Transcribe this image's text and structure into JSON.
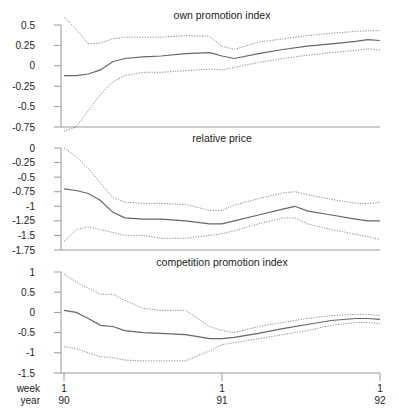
{
  "chart_data": [
    {
      "type": "line",
      "title": "own promotion index",
      "xlabel": "",
      "ylabel": "",
      "yticks": [
        "0.5",
        "0.25",
        "0",
        "-0.25",
        "-0.5",
        "-0.75"
      ],
      "ytick_values": [
        0.5,
        0.25,
        0,
        -0.25,
        -0.5,
        -0.75
      ],
      "ylim": [
        -0.75,
        0.5
      ],
      "x_weeks": [
        0,
        4,
        8,
        12,
        16,
        20,
        26,
        32,
        40,
        48,
        52,
        56,
        64,
        72,
        80,
        88,
        96,
        100,
        104
      ],
      "series": [
        {
          "name": "estimate",
          "style": "solid",
          "values": [
            -0.12,
            -0.12,
            -0.1,
            -0.05,
            0.05,
            0.09,
            0.11,
            0.12,
            0.15,
            0.16,
            0.12,
            0.09,
            0.15,
            0.2,
            0.24,
            0.27,
            0.3,
            0.32,
            0.31
          ]
        },
        {
          "name": "upper bound",
          "style": "dotted",
          "values": [
            0.6,
            0.45,
            0.27,
            0.28,
            0.33,
            0.35,
            0.35,
            0.35,
            0.37,
            0.36,
            0.24,
            0.2,
            0.29,
            0.33,
            0.37,
            0.4,
            0.42,
            0.43,
            0.43
          ]
        },
        {
          "name": "lower bound",
          "style": "dotted",
          "values": [
            -0.85,
            -0.75,
            -0.55,
            -0.35,
            -0.2,
            -0.12,
            -0.08,
            -0.08,
            -0.06,
            -0.04,
            -0.05,
            -0.02,
            0.04,
            0.09,
            0.13,
            0.16,
            0.19,
            0.21,
            0.19
          ]
        }
      ]
    },
    {
      "type": "line",
      "title": "relative price",
      "xlabel": "",
      "ylabel": "",
      "yticks": [
        "0",
        "-0.25",
        "-0.5",
        "-0.75",
        "-1",
        "-1.25",
        "-1.5",
        "-1.75"
      ],
      "ytick_values": [
        0,
        -0.25,
        -0.5,
        -0.75,
        -1,
        -1.25,
        -1.5,
        -1.75
      ],
      "ylim": [
        -1.75,
        0
      ],
      "x_weeks": [
        0,
        4,
        8,
        12,
        16,
        20,
        26,
        32,
        40,
        48,
        52,
        56,
        64,
        72,
        76,
        80,
        88,
        96,
        100,
        104
      ],
      "series": [
        {
          "name": "estimate",
          "style": "solid",
          "values": [
            -0.7,
            -0.73,
            -0.78,
            -0.9,
            -1.1,
            -1.2,
            -1.22,
            -1.22,
            -1.25,
            -1.3,
            -1.3,
            -1.25,
            -1.15,
            -1.05,
            -1.0,
            -1.08,
            -1.15,
            -1.22,
            -1.25,
            -1.25
          ]
        },
        {
          "name": "upper bound",
          "style": "dotted",
          "values": [
            0.0,
            -0.15,
            -0.35,
            -0.6,
            -0.85,
            -0.93,
            -0.95,
            -0.95,
            -0.97,
            -1.07,
            -1.07,
            -0.98,
            -0.87,
            -0.77,
            -0.75,
            -0.8,
            -0.88,
            -0.95,
            -0.95,
            -0.93
          ]
        },
        {
          "name": "lower bound",
          "style": "dotted",
          "values": [
            -1.6,
            -1.4,
            -1.35,
            -1.4,
            -1.45,
            -1.5,
            -1.5,
            -1.55,
            -1.55,
            -1.5,
            -1.47,
            -1.42,
            -1.3,
            -1.2,
            -1.2,
            -1.3,
            -1.4,
            -1.48,
            -1.52,
            -1.57
          ]
        }
      ]
    },
    {
      "type": "line",
      "title": "competition promotion index",
      "xlabel": "",
      "ylabel": "",
      "yticks": [
        "1",
        "0.5",
        "0",
        "-0.5",
        "-1",
        "-1.5"
      ],
      "ytick_values": [
        1,
        0.5,
        0,
        -0.5,
        -1,
        -1.5
      ],
      "ylim": [
        -1.5,
        1
      ],
      "x_weeks": [
        0,
        4,
        8,
        12,
        16,
        20,
        26,
        32,
        40,
        48,
        52,
        56,
        64,
        72,
        80,
        88,
        96,
        100,
        104
      ],
      "series": [
        {
          "name": "estimate",
          "style": "solid",
          "values": [
            0.05,
            0.0,
            -0.15,
            -0.32,
            -0.35,
            -0.45,
            -0.5,
            -0.52,
            -0.55,
            -0.65,
            -0.65,
            -0.62,
            -0.52,
            -0.4,
            -0.3,
            -0.2,
            -0.15,
            -0.15,
            -0.17
          ]
        },
        {
          "name": "upper bound",
          "style": "dotted",
          "values": [
            0.95,
            0.75,
            0.6,
            0.45,
            0.45,
            0.3,
            0.1,
            0.05,
            0.05,
            -0.35,
            -0.45,
            -0.5,
            -0.35,
            -0.25,
            -0.15,
            -0.08,
            -0.05,
            -0.05,
            -0.08
          ]
        },
        {
          "name": "lower bound",
          "style": "dotted",
          "values": [
            -0.85,
            -0.9,
            -1.0,
            -1.1,
            -1.12,
            -1.18,
            -1.2,
            -1.2,
            -1.2,
            -0.95,
            -0.8,
            -0.75,
            -0.65,
            -0.55,
            -0.45,
            -0.32,
            -0.25,
            -0.25,
            -0.28
          ]
        }
      ]
    }
  ],
  "x_axis": {
    "row_labels": [
      "week",
      "year"
    ],
    "ticks": [
      {
        "week": "1",
        "year": "90",
        "x_week": 0
      },
      {
        "week": "1",
        "year": "91",
        "x_week": 52
      },
      {
        "week": "1",
        "year": "92",
        "x_week": 104
      }
    ]
  }
}
